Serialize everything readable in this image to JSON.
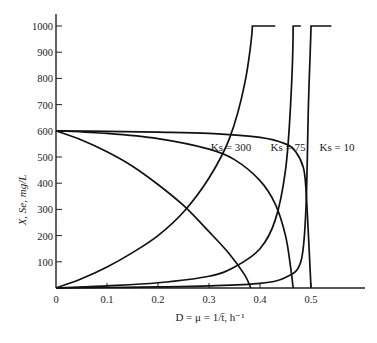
{
  "chart_data": {
    "type": "line",
    "title": "",
    "xlabel": "D = μ = 1/t̄, h⁻¹",
    "ylabel": "X, Se, mg/L",
    "xlim": [
      0,
      0.6
    ],
    "ylim": [
      0,
      1000
    ],
    "grid": false,
    "x_ticks": [
      0,
      0.1,
      0.2,
      0.3,
      0.4,
      0.5
    ],
    "x_tick_labels": [
      "0",
      "0.1",
      "0.2",
      "0.3",
      "0.4",
      "0.5"
    ],
    "y_ticks": [
      100,
      200,
      300,
      400,
      500,
      600,
      700,
      800,
      900,
      1000
    ],
    "y_tick_labels": [
      "100",
      "200",
      "300",
      "400",
      "500",
      "600",
      "700",
      "800",
      "900",
      "1000"
    ],
    "annotations": [
      {
        "text": "Ks = 300",
        "x": 0.33,
        "y": 770
      },
      {
        "text": "Ks = 75",
        "x": 0.42,
        "y": 770
      },
      {
        "text": "Ks = 10",
        "x": 0.52,
        "y": 770
      }
    ],
    "series": [
      {
        "name": "Se (Ks = 300)",
        "x": [
          0,
          0.05,
          0.1,
          0.15,
          0.2,
          0.25,
          0.3,
          0.34,
          0.37,
          0.385,
          0.43
        ],
        "y": [
          0,
          35,
          80,
          135,
          200,
          290,
          420,
          570,
          780,
          1000,
          1000
        ]
      },
      {
        "name": "Se (Ks = 75)",
        "x": [
          0,
          0.1,
          0.2,
          0.3,
          0.35,
          0.4,
          0.43,
          0.45,
          0.46,
          0.465,
          0.48
        ],
        "y": [
          0,
          8,
          20,
          45,
          80,
          150,
          260,
          450,
          700,
          1000,
          1000
        ]
      },
      {
        "name": "Se (Ks = 10)",
        "x": [
          0,
          0.1,
          0.2,
          0.3,
          0.4,
          0.45,
          0.48,
          0.49,
          0.495,
          0.5,
          0.54
        ],
        "y": [
          0,
          2,
          4,
          8,
          18,
          40,
          100,
          300,
          700,
          1000,
          1000
        ]
      },
      {
        "name": "X (Ks = 300)",
        "x": [
          0,
          0.05,
          0.1,
          0.15,
          0.2,
          0.25,
          0.3,
          0.34,
          0.37,
          0.382
        ],
        "y": [
          600,
          565,
          520,
          465,
          395,
          315,
          215,
          130,
          50,
          0
        ]
      },
      {
        "name": "X (Ks = 75)",
        "x": [
          0,
          0.1,
          0.2,
          0.3,
          0.35,
          0.4,
          0.43,
          0.45,
          0.46,
          0.465
        ],
        "y": [
          600,
          590,
          570,
          530,
          490,
          410,
          320,
          200,
          80,
          0
        ]
      },
      {
        "name": "X (Ks = 10)",
        "x": [
          0,
          0.1,
          0.2,
          0.3,
          0.4,
          0.45,
          0.47,
          0.485,
          0.49,
          0.495,
          0.5
        ],
        "y": [
          600,
          598,
          595,
          590,
          575,
          550,
          520,
          460,
          380,
          200,
          0
        ]
      }
    ]
  }
}
